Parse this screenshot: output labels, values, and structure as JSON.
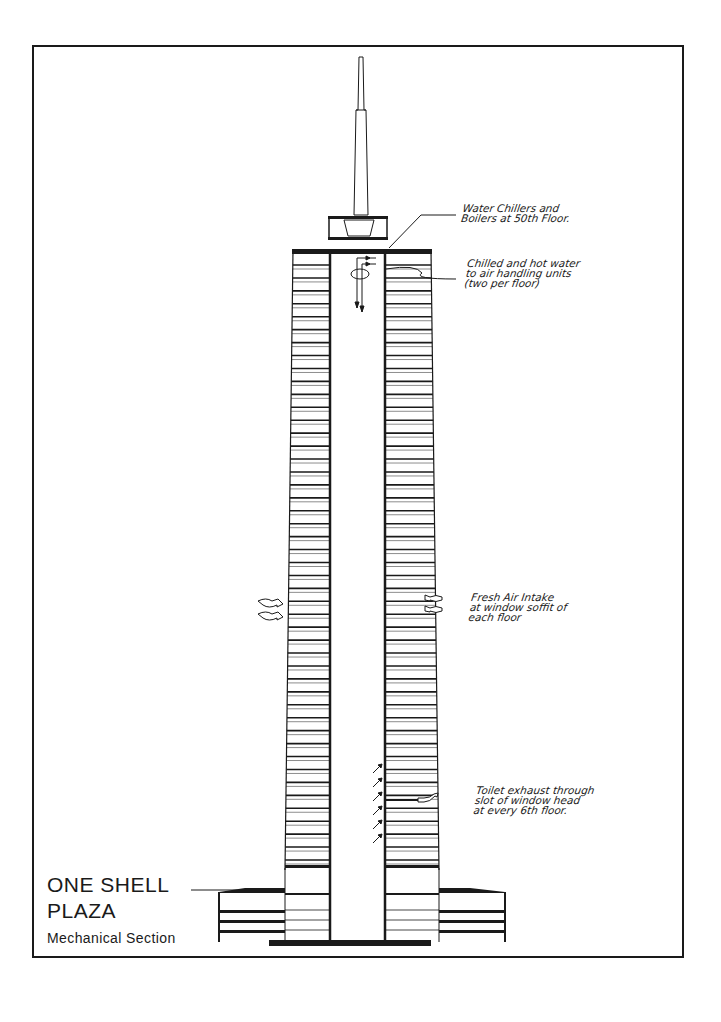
{
  "drawing": {
    "title_line1": "ONE SHELL",
    "title_line2": "PLAZA",
    "subtitle": "Mechanical Section",
    "line_color": "#1a1a1a",
    "paper_color": "#ffffff"
  },
  "annotations": [
    {
      "id": "chillers",
      "text": "Water Chillers and\nBoilers at 50th Floor."
    },
    {
      "id": "chilled-hot-water",
      "text": "Chilled and hot water\nto air handling units\n(two per floor)"
    },
    {
      "id": "fresh-air",
      "text": "Fresh Air Intake\nat window soffit of\neach floor"
    },
    {
      "id": "toilet-exhaust",
      "text": "Toilet exhaust through\nslot of window head\nat every 6th floor."
    }
  ],
  "building": {
    "tower_floor_count": 47,
    "mechanical_floor": "50th Floor",
    "podium_levels": 4
  }
}
